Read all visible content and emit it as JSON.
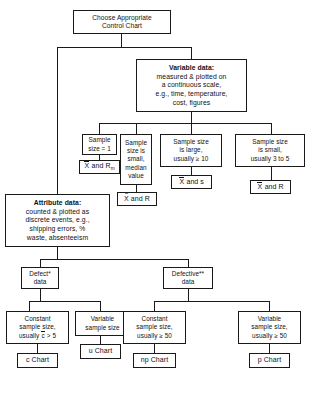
{
  "diagram": {
    "title": "Choose Appropriate Control Chart",
    "nodes": {
      "root": {
        "line1": "Choose Appropriate",
        "line2": "Control Chart"
      },
      "variable_data": {
        "heading": "Variable data:",
        "line1": "measured & plotted on",
        "line2": "a continuous scale,",
        "line3": "e.g., time, temperature,",
        "line4": "cost, figures"
      },
      "attribute_data": {
        "heading": "Attribute data:",
        "line1": "counted & plotted as",
        "line2": "discrete events, e.g.,",
        "line3": "shipping errors, %",
        "line4": "waste, absenteeism"
      },
      "v_n1": {
        "line1": "Sample",
        "line2": "size = 1"
      },
      "v_median": {
        "line1": "Sample",
        "line2": "size is",
        "line3": "small,",
        "line4": "median",
        "line5": "value"
      },
      "v_large": {
        "line1": "Sample size",
        "line2": "is large,",
        "line3": "usually ≥ 10"
      },
      "v_small": {
        "line1": "Sample size",
        "line2": "is small,",
        "line3": "usually 3 to 5"
      },
      "chart_x_rm": {
        "pre": "X",
        "post": " and R",
        "sub": "m",
        "label": "X and Rm"
      },
      "chart_xtilde_r": {
        "pre": "X",
        "post": " and R",
        "label": "X and R"
      },
      "chart_xbar_s": {
        "pre": "X",
        "post": " and s",
        "label": "X and s"
      },
      "chart_xbar_r": {
        "pre": "X",
        "post": " and R",
        "label": "X and R"
      },
      "defect": {
        "line1": "Defect*",
        "line2": "data"
      },
      "defective": {
        "line1": "Defective**",
        "line2": "data"
      },
      "d_constant": {
        "line1": "Constant",
        "line2": "sample size,",
        "pre": "usually ",
        "ov": "c",
        "post": " > 5"
      },
      "d_variable": {
        "line1": "Variable",
        "line2": "sample size"
      },
      "dv_constant": {
        "line1": "Constant",
        "line2": "sample size,",
        "line3": "usually ≥ 50"
      },
      "dv_variable": {
        "line1": "Variable",
        "line2": "sample size,",
        "line3": "usually ≥ 50"
      },
      "chart_c": {
        "label": "c Chart"
      },
      "chart_u": {
        "label": "u Chart"
      },
      "chart_np": {
        "label": "np Chart"
      },
      "chart_p": {
        "label": "p Chart"
      }
    },
    "colors": {
      "line": "#1a1a1a",
      "box_fill": "#ffffff",
      "text": "#111111"
    }
  }
}
